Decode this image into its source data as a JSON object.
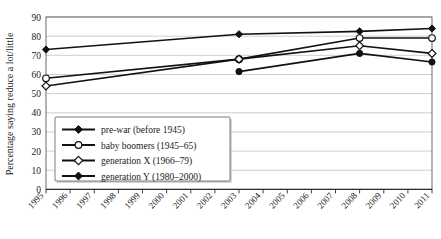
{
  "chart_data": {
    "type": "line",
    "title": "",
    "xlabel": "",
    "ylabel": "Percentage saying reduce a lot/little",
    "ylim": [
      0,
      90
    ],
    "ytick_step": 10,
    "yticks": [
      0,
      10,
      20,
      30,
      40,
      50,
      60,
      70,
      80,
      90
    ],
    "grid": true,
    "legend_position": "lower-left inside plot area",
    "categories": [
      "1995",
      "1996",
      "1997",
      "1998",
      "1999",
      "2000",
      "2001",
      "2002",
      "2003",
      "2004",
      "2005",
      "2006",
      "2007",
      "2008",
      "2009",
      "2010",
      "2011"
    ],
    "series": [
      {
        "name": "pre-war (before 1945)",
        "marker": "filled-diamond",
        "x": [
          "1995",
          "2003",
          "2008",
          "2011"
        ],
        "values": [
          73,
          81,
          82.5,
          84
        ]
      },
      {
        "name": "baby boomers (1945–65)",
        "marker": "open-circle",
        "x": [
          "1995",
          "2003",
          "2008",
          "2011"
        ],
        "values": [
          58,
          68,
          79,
          79
        ]
      },
      {
        "name": "generation X (1966–79)",
        "marker": "open-diamond",
        "x": [
          "1995",
          "2003",
          "2008",
          "2011"
        ],
        "values": [
          54,
          68,
          75,
          71
        ]
      },
      {
        "name": "generation Y (1980–2000)",
        "marker": "filled-circle",
        "x": [
          "2003",
          "2008",
          "2011"
        ],
        "values": [
          61.5,
          71,
          66.5
        ]
      }
    ]
  },
  "legend": {
    "items": [
      {
        "label": "pre-war (before 1945)",
        "marker": "filled-diamond"
      },
      {
        "label": "baby boomers (1945–65)",
        "marker": "open-circle"
      },
      {
        "label": "generation X (1966–79)",
        "marker": "open-diamond"
      },
      {
        "label": "generation Y (1980–2000)",
        "marker": "filled-circle"
      }
    ]
  },
  "axes": {
    "y_label": "Percentage saying reduce a lot/little",
    "y_ticks": [
      "90",
      "80",
      "70",
      "60",
      "50",
      "40",
      "30",
      "20",
      "10",
      "0"
    ],
    "x_ticks": [
      "1995",
      "1996",
      "1997",
      "1998",
      "1999",
      "2000",
      "2001",
      "2002",
      "2003",
      "2004",
      "2005",
      "2006",
      "2007",
      "2008",
      "2009",
      "2010",
      "2011"
    ]
  },
  "colors": {
    "line": "#111111",
    "grid": "#b9b9b9",
    "frame": "#5a5a5a",
    "text": "#1a1a1a"
  }
}
